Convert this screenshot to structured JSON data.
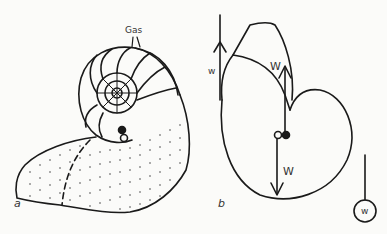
{
  "figure": {
    "panel_a": {
      "label": "a",
      "gas_label": "Gas"
    },
    "panel_b": {
      "label": "b",
      "small_weight_label": "w",
      "upper_force_label": "W",
      "lower_force_label": "W",
      "hanging_weight_label": "w"
    }
  },
  "colors": {
    "ink": "#1a1a1a",
    "background": "#fbfbf9"
  }
}
